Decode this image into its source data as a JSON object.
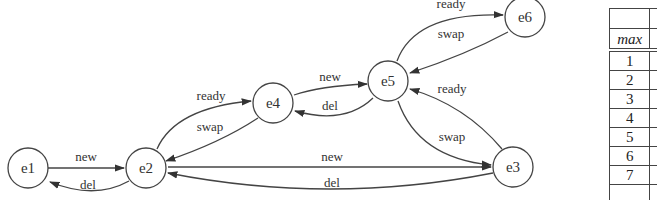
{
  "diagram": {
    "type": "state-machine",
    "nodes": [
      {
        "id": "e1",
        "label": "e1",
        "x": 28,
        "y": 168
      },
      {
        "id": "e2",
        "label": "e2",
        "x": 146,
        "y": 168
      },
      {
        "id": "e4",
        "label": "e4",
        "x": 273,
        "y": 103
      },
      {
        "id": "e5",
        "label": "e5",
        "x": 388,
        "y": 81
      },
      {
        "id": "e6",
        "label": "e6",
        "x": 525,
        "y": 17
      },
      {
        "id": "e3",
        "label": "e3",
        "x": 513,
        "y": 167
      }
    ],
    "edges": [
      {
        "from": "e1",
        "to": "e2",
        "label": "new"
      },
      {
        "from": "e2",
        "to": "e1",
        "label": "del"
      },
      {
        "from": "e2",
        "to": "e4",
        "label": "ready"
      },
      {
        "from": "e4",
        "to": "e2",
        "label": "swap"
      },
      {
        "from": "e4",
        "to": "e5",
        "label": "new"
      },
      {
        "from": "e5",
        "to": "e4",
        "label": "del"
      },
      {
        "from": "e5",
        "to": "e6",
        "label": "ready"
      },
      {
        "from": "e6",
        "to": "e5",
        "label": "swap"
      },
      {
        "from": "e3",
        "to": "e5",
        "label": "ready"
      },
      {
        "from": "e5",
        "to": "e3",
        "label": "swap"
      },
      {
        "from": "e2",
        "to": "e3",
        "label": "new"
      },
      {
        "from": "e3",
        "to": "e2",
        "label": "del"
      }
    ]
  },
  "table": {
    "header": "",
    "max_label": "max",
    "rows": [
      "1",
      "2",
      "3",
      "4",
      "5",
      "6",
      "7",
      ""
    ]
  }
}
